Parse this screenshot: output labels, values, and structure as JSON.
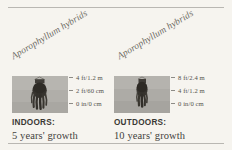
{
  "figure": {
    "background_color": "#f6f4ef",
    "rule_color": "#b9b7b2",
    "photo_bg_color": "#aeaca7",
    "plant_color": "#34312c"
  },
  "panels": [
    {
      "id": "indoors",
      "species_label": "Aporophyllum hybrids",
      "photo_alt": "hanging-cactus-plant",
      "scale": {
        "ticks": [
          {
            "label": "4 ft/1.2 m"
          },
          {
            "label": "2 ft/60 cm"
          },
          {
            "label": "0 in/0 cm"
          }
        ]
      },
      "caption": {
        "heading": "INDOORS:",
        "subtext": "5 years' growth"
      }
    },
    {
      "id": "outdoors",
      "species_label": "Aporophyllum hybrids",
      "photo_alt": "hanging-cactus-plant",
      "scale": {
        "ticks": [
          {
            "label": "8 ft/2.4 m"
          },
          {
            "label": "4 ft/1.2 m"
          },
          {
            "label": "0 in/0 cm"
          }
        ]
      },
      "caption": {
        "heading": "OUTDOORS:",
        "subtext": "10 years' growth"
      }
    }
  ]
}
